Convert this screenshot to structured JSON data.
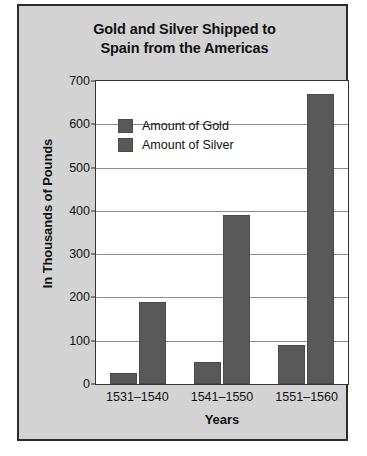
{
  "chart_data": {
    "type": "bar",
    "title": "Gold and Silver Shipped to Spain from the Americas",
    "title_line1": "Gold and Silver Shipped to",
    "title_line2": "Spain from the Americas",
    "xlabel": "Years",
    "ylabel": "In Thousands of Pounds",
    "categories": [
      "1531–1540",
      "1541–1550",
      "1551–1560"
    ],
    "series": [
      {
        "name": "Amount of Gold",
        "values": [
          25,
          50,
          90
        ],
        "color": "#595959"
      },
      {
        "name": "Amount of Silver",
        "values": [
          190,
          390,
          670
        ],
        "color": "#595959"
      }
    ],
    "ylim": [
      0,
      700
    ],
    "yticks": [
      0,
      100,
      200,
      300,
      400,
      500,
      600,
      700
    ],
    "ytick_labels": [
      "0",
      "100",
      "200",
      "300",
      "400",
      "500",
      "600",
      "700"
    ],
    "grid": true,
    "legend_position": "upper-left-inside",
    "plot_background": "#ffffff",
    "panel_background": "#d3d3d3"
  }
}
